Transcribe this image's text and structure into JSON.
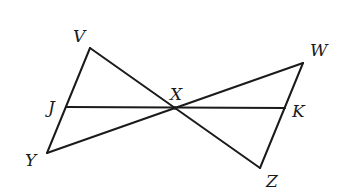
{
  "diagram": {
    "title": "",
    "colors": {
      "stroke": "#1a1a1a",
      "background": "#ffffff"
    },
    "points": [
      {
        "id": "V",
        "label": "V",
        "x": 90,
        "y": 48,
        "lx": 73,
        "ly": 42
      },
      {
        "id": "Y",
        "label": "Y",
        "x": 47,
        "y": 153,
        "lx": 25,
        "ly": 166
      },
      {
        "id": "W",
        "label": "W",
        "x": 303,
        "y": 63,
        "lx": 310,
        "ly": 56
      },
      {
        "id": "Z",
        "label": "Z",
        "x": 260,
        "y": 168,
        "lx": 266,
        "ly": 187
      },
      {
        "id": "X",
        "label": "X",
        "x": 175,
        "y": 108,
        "lx": 170,
        "ly": 100
      },
      {
        "id": "J",
        "label": "J",
        "x": 66,
        "y": 107,
        "lx": 48,
        "ly": 113
      },
      {
        "id": "K",
        "label": "K",
        "x": 285,
        "y": 108,
        "lx": 292,
        "ly": 117
      }
    ],
    "segments": [
      {
        "from": "V",
        "to": "Y"
      },
      {
        "from": "V",
        "to": "Z"
      },
      {
        "from": "Y",
        "to": "W"
      },
      {
        "from": "W",
        "to": "Z"
      },
      {
        "from": "J",
        "to": "K"
      }
    ]
  }
}
